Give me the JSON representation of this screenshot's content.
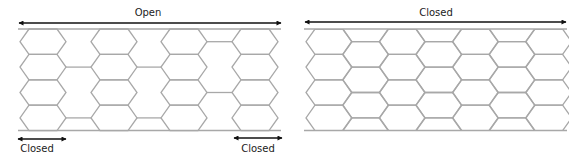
{
  "colors": {
    "mesh": "#a8a8a8",
    "arrow": "#111111",
    "text": "#222222",
    "background": "#ffffff"
  },
  "left_panel": {
    "title": "Open",
    "state": "open",
    "top_label": {
      "text": "Open",
      "x": 148,
      "y": 8
    },
    "top_arrow": {
      "x1": 18,
      "x2": 282,
      "y": 23
    },
    "rails": {
      "x1": 18,
      "x2": 281,
      "top": 29,
      "bottom": 130.5
    },
    "columns_x": [
      20,
      91,
      161,
      232
    ],
    "hex": {
      "width": 46,
      "slant": 9,
      "height": 25.4,
      "rows": 4
    },
    "links": [
      {
        "from_col": 0,
        "to_col": 1,
        "rows": [
          1,
          3
        ]
      },
      {
        "from_col": 1,
        "to_col": 2,
        "rows": [
          1,
          3
        ]
      },
      {
        "from_col": 2,
        "to_col": 3,
        "rows": [
          0,
          2
        ]
      }
    ],
    "bottom_labels": [
      {
        "text": "Closed",
        "x": 37,
        "y": 144,
        "arrow": {
          "x1": 17,
          "x2": 67,
          "y": 139
        }
      },
      {
        "text": "Closed",
        "x": 258,
        "y": 144,
        "arrow": {
          "x1": 233,
          "x2": 283,
          "y": 138
        }
      }
    ]
  },
  "right_panel": {
    "title": "Closed",
    "state": "closed",
    "top_label": {
      "text": "Closed",
      "x": 436,
      "y": 8
    },
    "top_arrow": {
      "x1": 304,
      "x2": 567,
      "y": 22
    },
    "rails": {
      "x1": 304,
      "x2": 567,
      "top": 29,
      "bottom": 130.5
    },
    "start_x": 306,
    "col_step": 36.6,
    "columns": 7,
    "hex": {
      "width": 46,
      "slant": 9,
      "height": 25.4
    }
  }
}
